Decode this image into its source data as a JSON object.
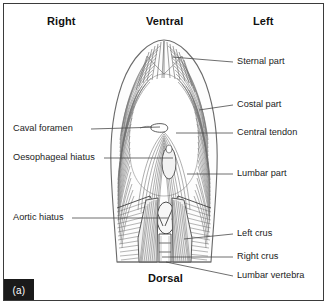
{
  "figure": {
    "panel_tag": "(a)",
    "border_color": "#3b3b3b",
    "background_color": "#ffffff",
    "ink_color": "#555555",
    "text_color": "#1c1c1c"
  },
  "orientation_labels": [
    {
      "name": "right",
      "text": "Right",
      "x": 47,
      "y": 22
    },
    {
      "name": "ventral",
      "text": "Ventral",
      "x": 146,
      "y": 22
    },
    {
      "name": "left",
      "text": "Left",
      "x": 253,
      "y": 22
    },
    {
      "name": "dorsal",
      "text": "Dorsal",
      "x": 148,
      "y": 279
    }
  ],
  "callouts_right": [
    {
      "name": "sternal-part",
      "text": "Sternal part",
      "label_x": 237,
      "label_y": 58,
      "leader": {
        "x1": 172,
        "y1": 57,
        "x2": 233,
        "y2": 62
      }
    },
    {
      "name": "costal-part",
      "text": "Costal part",
      "label_x": 237,
      "label_y": 100,
      "leader": {
        "x1": 199,
        "y1": 110,
        "x2": 233,
        "y2": 105
      }
    },
    {
      "name": "central-tendon",
      "text": "Central tendon",
      "label_x": 237,
      "label_y": 129,
      "leader": {
        "x1": 176,
        "y1": 133,
        "x2": 233,
        "y2": 133
      }
    },
    {
      "name": "lumbar-part",
      "text": "Lumbar part",
      "label_x": 237,
      "label_y": 170,
      "leader": {
        "x1": 187,
        "y1": 174,
        "x2": 233,
        "y2": 174
      }
    },
    {
      "name": "left-crus",
      "text": "Left crus",
      "label_x": 237,
      "label_y": 230,
      "leader": {
        "x1": 184,
        "y1": 239,
        "x2": 233,
        "y2": 234
      }
    },
    {
      "name": "right-crus",
      "text": "Right crus",
      "label_x": 237,
      "label_y": 253,
      "leader": {
        "x1": 162,
        "y1": 257,
        "x2": 233,
        "y2": 257
      }
    },
    {
      "name": "lumbar-vertebra",
      "text": "Lumbar vertebra",
      "label_x": 237,
      "label_y": 272,
      "leader": {
        "x1": 166,
        "y1": 262,
        "x2": 233,
        "y2": 276
      }
    }
  ],
  "callouts_left": [
    {
      "name": "caval-foramen",
      "text": "Caval foramen",
      "label_x": 13,
      "label_y": 125,
      "leader": {
        "x1": 91,
        "y1": 129,
        "x2": 160,
        "y2": 127
      }
    },
    {
      "name": "oesophageal-hiatus",
      "text": "Oesophageal hiatus",
      "label_x": 13,
      "label_y": 154,
      "leader": {
        "x1": 104,
        "y1": 158,
        "x2": 173,
        "y2": 158
      }
    },
    {
      "name": "aortic-hiatus",
      "text": "Aortic hiatus",
      "label_x": 13,
      "label_y": 214,
      "leader": {
        "x1": 72,
        "y1": 218,
        "x2": 168,
        "y2": 218
      }
    }
  ],
  "anatomy_structures": [
    "diaphragm-outline",
    "sternal-part-fibers",
    "costal-part-fibers",
    "central-tendon",
    "caval-foramen-opening",
    "oesophageal-hiatus-opening",
    "aortic-hiatus-opening",
    "lumbar-part-fibers",
    "left-crus",
    "right-crus",
    "lumbar-vertebra"
  ]
}
